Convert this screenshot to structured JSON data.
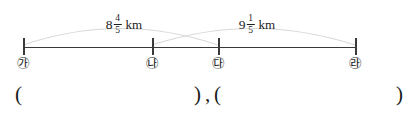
{
  "figure": {
    "type": "number-line-diagram",
    "line": {
      "x_start": 23,
      "x_end": 355,
      "y": 47,
      "color": "#3a3a3a"
    },
    "arc_color": "#d8d8d8",
    "points": [
      {
        "id": "ga",
        "label": "㉮",
        "x": 23
      },
      {
        "id": "na",
        "label": "㉯",
        "x": 152
      },
      {
        "id": "da",
        "label": "㉰",
        "x": 218
      },
      {
        "id": "ra",
        "label": "㉱",
        "x": 355
      }
    ],
    "measures": [
      {
        "id": "measure-1",
        "from": "ga",
        "to": "da",
        "whole": "8",
        "numerator": "4",
        "denominator": "5",
        "unit": "km",
        "label_x": 124,
        "label_y": 14,
        "arc_apex_y": 20
      },
      {
        "id": "measure-2",
        "from": "na",
        "to": "ra",
        "whole": "9",
        "numerator": "1",
        "denominator": "5",
        "unit": "km",
        "label_x": 257,
        "label_y": 14,
        "arc_apex_y": 20
      }
    ]
  },
  "answer_row": {
    "open_paren_1": "(",
    "close_paren_1": ")",
    "separator": ",",
    "open_paren_2": "(",
    "close_paren_2": ")",
    "positions": {
      "open_1": 15,
      "close_1": 194,
      "comma": 205,
      "open_2": 214,
      "close_2": 396
    }
  }
}
